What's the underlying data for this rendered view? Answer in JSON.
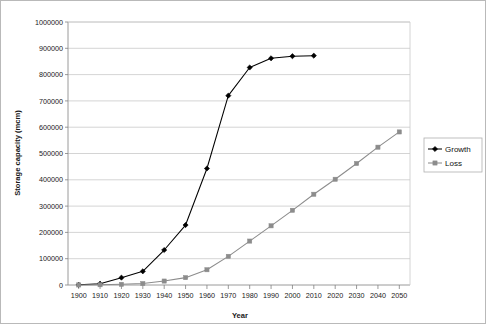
{
  "chart_data": {
    "type": "line",
    "title": "",
    "xlabel": "Year",
    "ylabel": "Storage capacity (mcm)",
    "x": [
      1900,
      1910,
      1920,
      1930,
      1940,
      1950,
      1960,
      1970,
      1980,
      1990,
      2000,
      2010,
      2020,
      2030,
      2040,
      2050
    ],
    "xlim": [
      1895,
      2055
    ],
    "ylim": [
      0,
      1000000
    ],
    "xticks": [
      "1900",
      "1910",
      "1920",
      "1930",
      "1940",
      "1950",
      "1960",
      "1970",
      "1980",
      "1990",
      "2000",
      "2010",
      "2020",
      "2030",
      "2040",
      "2050"
    ],
    "yticks": [
      "0",
      "100000",
      "200000",
      "300000",
      "400000",
      "500000",
      "600000",
      "700000",
      "800000",
      "900000",
      "1000000"
    ],
    "grid": "horizontal",
    "legend_position": "right",
    "series": [
      {
        "name": "Growth",
        "color": "#000000",
        "marker": "diamond",
        "x": [
          1900,
          1910,
          1920,
          1930,
          1940,
          1950,
          1960,
          1970,
          1980,
          1990,
          2000,
          2010
        ],
        "values": [
          1000,
          5000,
          28000,
          52000,
          133000,
          228000,
          443000,
          720000,
          827000,
          862000,
          870000,
          872000
        ]
      },
      {
        "name": "Loss",
        "color": "#8c8c8c",
        "marker": "square",
        "x": [
          1900,
          1910,
          1920,
          1930,
          1940,
          1950,
          1960,
          1970,
          1980,
          1990,
          2000,
          2010,
          2020,
          2030,
          2040,
          2050
        ],
        "values": [
          200,
          1000,
          2500,
          5500,
          15000,
          28000,
          58000,
          109000,
          167000,
          225000,
          284000,
          345000,
          402000,
          462000,
          524000,
          582000
        ]
      }
    ]
  },
  "legend": {
    "items": [
      {
        "label": "Growth"
      },
      {
        "label": "Loss"
      }
    ]
  }
}
